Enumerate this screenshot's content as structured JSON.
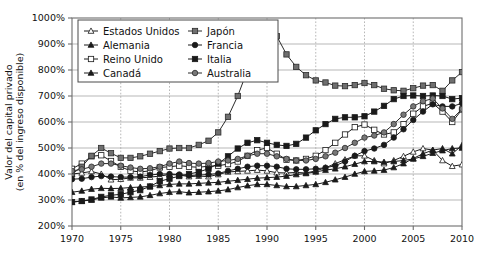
{
  "chart_data": {
    "type": "line",
    "title": "",
    "xlabel": "",
    "ylabel": "Valor del capital privado\n(en % del ingreso disponible)",
    "ylabel_line1": "Valor del capital privado",
    "ylabel_line2": "(en % del ingreso disponible)",
    "xlim": [
      1970,
      2010
    ],
    "ylim": [
      200,
      1000
    ],
    "xticks": [
      1970,
      1975,
      1980,
      1985,
      1990,
      1995,
      2000,
      2005,
      2010
    ],
    "xtick_labels": [
      "1970",
      "1975",
      "1980",
      "1985",
      "1990",
      "1995",
      "2000",
      "2005",
      "2010"
    ],
    "yticks": [
      200,
      300,
      400,
      500,
      600,
      700,
      800,
      900,
      1000
    ],
    "ytick_labels": [
      "200%",
      "300%",
      "400%",
      "500%",
      "600%",
      "700%",
      "800%",
      "900%",
      "1000%"
    ],
    "grid": "both",
    "legend_position": "top-left-inside",
    "legend_columns": 2,
    "x": [
      1970,
      1971,
      1972,
      1973,
      1974,
      1975,
      1976,
      1977,
      1978,
      1979,
      1980,
      1981,
      1982,
      1983,
      1984,
      1985,
      1986,
      1987,
      1988,
      1989,
      1990,
      1991,
      1992,
      1993,
      1994,
      1995,
      1996,
      1997,
      1998,
      1999,
      2000,
      2001,
      2002,
      2003,
      2004,
      2005,
      2006,
      2007,
      2008,
      2009,
      2010
    ],
    "series": [
      {
        "name": "Estados Unidos",
        "marker": "triangle-open",
        "color": "#1a1a1a",
        "fill": "#ffffff",
        "values": [
          400,
          404,
          410,
          400,
          378,
          380,
          385,
          385,
          388,
          392,
          398,
          396,
          390,
          392,
          390,
          398,
          408,
          410,
          412,
          415,
          412,
          405,
          404,
          406,
          404,
          412,
          424,
          440,
          455,
          470,
          470,
          452,
          440,
          452,
          468,
          485,
          498,
          492,
          452,
          430,
          436
        ]
      },
      {
        "name": "Alemania",
        "marker": "triangle-filled",
        "color": "#1a1a1a",
        "fill": "#1a1a1a",
        "values": [
          330,
          335,
          342,
          345,
          344,
          345,
          348,
          350,
          352,
          356,
          360,
          362,
          362,
          364,
          366,
          368,
          372,
          376,
          380,
          384,
          386,
          388,
          392,
          398,
          402,
          408,
          415,
          420,
          428,
          438,
          448,
          448,
          446,
          448,
          452,
          458,
          468,
          480,
          490,
          498,
          500
        ]
      },
      {
        "name": "Reino Unido",
        "marker": "square-open",
        "color": "#1a1a1a",
        "fill": "#ffffff",
        "values": [
          420,
          440,
          468,
          472,
          450,
          428,
          412,
          408,
          412,
          425,
          428,
          432,
          428,
          426,
          430,
          432,
          438,
          448,
          470,
          492,
          500,
          478,
          455,
          452,
          458,
          470,
          492,
          520,
          552,
          580,
          590,
          570,
          552,
          560,
          592,
          632,
          660,
          672,
          640,
          600,
          648
        ]
      },
      {
        "name": "Canadá",
        "marker": "triangle-filled-dark",
        "color": "#1a1a1a",
        "fill": "#1a1a1a",
        "values": [
          292,
          296,
          300,
          308,
          312,
          308,
          310,
          312,
          318,
          325,
          330,
          332,
          328,
          330,
          332,
          335,
          340,
          348,
          355,
          360,
          360,
          356,
          352,
          352,
          356,
          360,
          368,
          378,
          388,
          400,
          410,
          412,
          415,
          425,
          440,
          460,
          478,
          492,
          498,
          478,
          510
        ]
      },
      {
        "name": "Japón",
        "marker": "square-gray",
        "color": "#2b2b2b",
        "fill": "#6f6f6f",
        "values": [
          400,
          428,
          470,
          500,
          480,
          462,
          462,
          468,
          478,
          488,
          498,
          500,
          500,
          512,
          528,
          560,
          620,
          700,
          800,
          880,
          950,
          930,
          860,
          812,
          780,
          760,
          752,
          740,
          738,
          742,
          750,
          742,
          728,
          722,
          720,
          730,
          740,
          742,
          720,
          760,
          792
        ]
      },
      {
        "name": "Francia",
        "marker": "circle-filled",
        "color": "#1a1a1a",
        "fill": "#1a1a1a",
        "values": [
          380,
          382,
          388,
          392,
          390,
          388,
          388,
          390,
          396,
          400,
          400,
          398,
          394,
          396,
          398,
          402,
          412,
          420,
          428,
          432,
          432,
          428,
          420,
          418,
          418,
          420,
          424,
          432,
          448,
          470,
          488,
          498,
          512,
          540,
          572,
          608,
          640,
          668,
          660,
          660,
          672
        ]
      },
      {
        "name": "Italia",
        "marker": "square-filled",
        "color": "#1a1a1a",
        "fill": "#1a1a1a",
        "values": [
          292,
          296,
          302,
          312,
          318,
          322,
          330,
          338,
          352,
          372,
          382,
          392,
          400,
          408,
          420,
          440,
          468,
          498,
          520,
          530,
          520,
          512,
          508,
          516,
          540,
          568,
          592,
          612,
          618,
          618,
          622,
          640,
          662,
          688,
          700,
          702,
          700,
          702,
          700,
          688,
          692
        ]
      },
      {
        "name": "Australia",
        "marker": "circle-gray",
        "color": "#2b2b2b",
        "fill": "#787878",
        "values": [
          412,
          418,
          428,
          440,
          440,
          432,
          425,
          420,
          422,
          428,
          440,
          448,
          442,
          440,
          442,
          448,
          452,
          458,
          470,
          478,
          478,
          468,
          458,
          452,
          452,
          458,
          468,
          482,
          500,
          520,
          540,
          548,
          560,
          592,
          628,
          660,
          680,
          690,
          652,
          612,
          650
        ]
      }
    ]
  },
  "legend": {
    "entries": [
      {
        "label": "Estados Unidos"
      },
      {
        "label": "Japón"
      },
      {
        "label": "Alemania"
      },
      {
        "label": "Francia"
      },
      {
        "label": "Reino Unido"
      },
      {
        "label": "Italia"
      },
      {
        "label": "Canadá"
      },
      {
        "label": "Australia"
      }
    ]
  }
}
